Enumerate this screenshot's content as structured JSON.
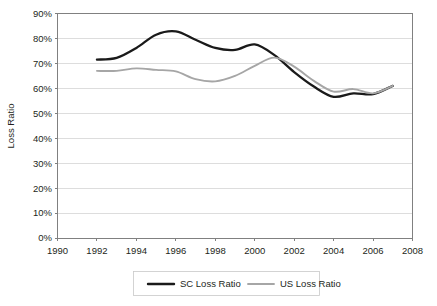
{
  "chart_data": {
    "type": "line",
    "title": "",
    "xlabel": "",
    "ylabel": "Loss Ratio",
    "xlim": [
      1990,
      2008
    ],
    "ylim": [
      0,
      0.9
    ],
    "grid": true,
    "legend_position": "bottom",
    "x_ticks": [
      "1990",
      "1992",
      "1994",
      "1996",
      "1998",
      "2000",
      "2002",
      "2004",
      "2006",
      "2008"
    ],
    "y_ticks": [
      "0%",
      "10%",
      "20%",
      "30%",
      "40%",
      "50%",
      "60%",
      "70%",
      "80%",
      "90%"
    ],
    "x": [
      1992,
      1993,
      1994,
      1995,
      1996,
      1997,
      1998,
      1999,
      2000,
      2001,
      2002,
      2003,
      2004,
      2005,
      2006,
      2007
    ],
    "series": [
      {
        "name": "SC Loss Ratio",
        "color": "#1a1a1a",
        "values": [
          0.715,
          0.722,
          0.762,
          0.815,
          0.828,
          0.795,
          0.762,
          0.754,
          0.776,
          0.733,
          0.665,
          0.607,
          0.566,
          0.58,
          0.577,
          0.61
        ]
      },
      {
        "name": "US Loss Ratio",
        "color": "#a6a6a6",
        "values": [
          0.67,
          0.67,
          0.68,
          0.674,
          0.668,
          0.637,
          0.628,
          0.65,
          0.69,
          0.723,
          0.687,
          0.63,
          0.587,
          0.597,
          0.58,
          0.61
        ]
      }
    ]
  },
  "legend": {
    "items": [
      {
        "label": "SC Loss Ratio",
        "color": "#1a1a1a"
      },
      {
        "label": "US Loss Ratio",
        "color": "#a6a6a6"
      }
    ]
  },
  "axes": {
    "y_title": "Loss Ratio"
  }
}
